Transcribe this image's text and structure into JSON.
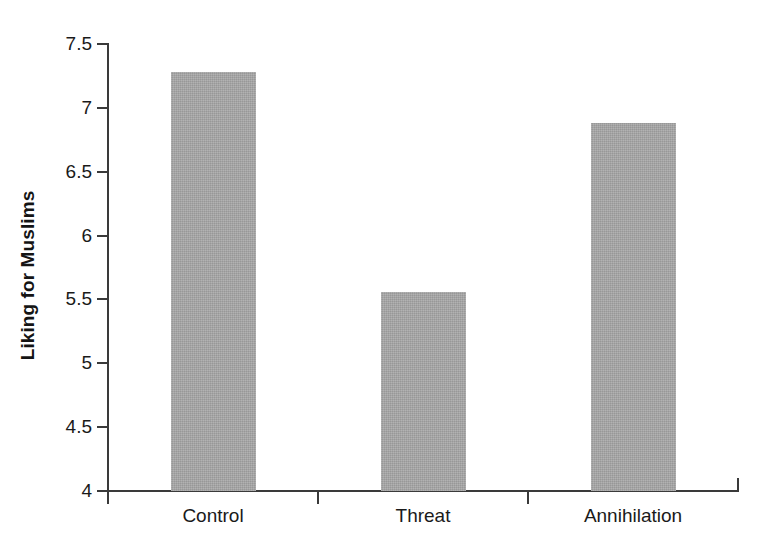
{
  "chart_data": {
    "type": "bar",
    "title": "",
    "subtitle": "",
    "xlabel": "",
    "ylabel": "Liking for Muslims",
    "categories": [
      "Control",
      "Threat",
      "Annihilation"
    ],
    "values": [
      7.28,
      5.56,
      6.88
    ],
    "series": [
      {
        "name": "Liking for Muslims",
        "values": [
          7.28,
          5.56,
          6.88
        ]
      }
    ],
    "ylim": [
      4,
      7.5
    ],
    "xlim": [
      0,
      3
    ],
    "y_ticks": [
      4,
      4.5,
      5,
      5.5,
      6,
      6.5,
      7,
      7.5
    ],
    "y_tick_labels": [
      "4",
      "4.5",
      "5",
      "5.5",
      "6",
      "6.5",
      "7",
      "7.5"
    ],
    "grid": false,
    "legend": null,
    "legend_position": "none",
    "bar_color": "#a9a9a9",
    "axis_color": "#3a3a3a",
    "background_color": "#ffffff",
    "annotations": []
  }
}
